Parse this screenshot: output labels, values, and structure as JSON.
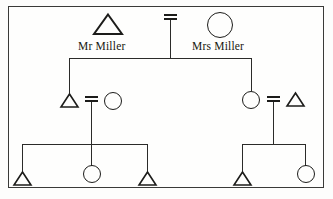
{
  "figure": {
    "border_color": "#3a3a38",
    "line_color": "#2b2b29",
    "symbol_color": "#1c1c1a",
    "background": "#fdfdfc"
  },
  "generation1": {
    "father": {
      "symbol": "triangle",
      "meaning": "male",
      "label": "Mr Miller"
    },
    "mother": {
      "symbol": "circle",
      "meaning": "female",
      "label": "Mrs Miller"
    },
    "union": {
      "symbol": "equals",
      "meaning": "marriage"
    }
  },
  "generation2": {
    "left_couple": {
      "spouse_left": {
        "symbol": "triangle",
        "meaning": "male",
        "label": ""
      },
      "union": {
        "symbol": "equals",
        "meaning": "marriage"
      },
      "spouse_right": {
        "symbol": "circle",
        "meaning": "female",
        "label": ""
      },
      "child_of_generation1": "spouse_left"
    },
    "right_couple": {
      "spouse_left": {
        "symbol": "circle",
        "meaning": "female",
        "label": ""
      },
      "union": {
        "symbol": "equals",
        "meaning": "marriage"
      },
      "spouse_right": {
        "symbol": "triangle",
        "meaning": "male",
        "label": ""
      },
      "child_of_generation1": "spouse_left"
    }
  },
  "generation3": {
    "left_children": [
      {
        "symbol": "triangle",
        "meaning": "male",
        "label": ""
      },
      {
        "symbol": "circle",
        "meaning": "female",
        "label": ""
      },
      {
        "symbol": "triangle",
        "meaning": "male",
        "label": ""
      }
    ],
    "right_children": [
      {
        "symbol": "triangle",
        "meaning": "male",
        "label": ""
      },
      {
        "symbol": "circle",
        "meaning": "female",
        "label": ""
      }
    ]
  }
}
